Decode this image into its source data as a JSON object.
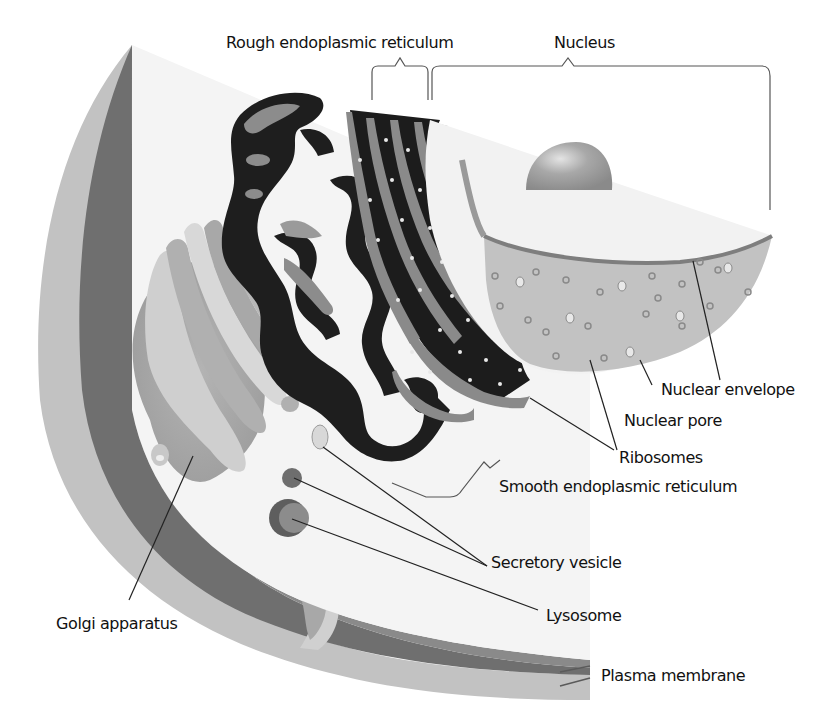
{
  "diagram": {
    "labels": {
      "rough_er": "Rough endoplasmic reticulum",
      "nucleus": "Nucleus",
      "nuclear_envelope": "Nuclear envelope",
      "nuclear_pore": "Nuclear pore",
      "ribosomes": "Ribosomes",
      "smooth_er": "Smooth endoplasmic reticulum",
      "secretory_vesicle": "Secretory vesicle",
      "lysosome": "Lysosome",
      "golgi": "Golgi apparatus",
      "plasma_membrane": "Plasma membrane"
    },
    "colors": {
      "cytoplasm": "#f2f2f2",
      "membrane_outer": "#bcbcbc",
      "membrane_dark": "#6e6e6e",
      "golgi": "#a6a6a6",
      "smooth_er": "#1e1e1e",
      "rough_er_band": "#8c8c8c",
      "nucleoplasm": "#c4c4c4",
      "nucleolus": "#9a9a9a",
      "leader_line": "#222222"
    }
  }
}
